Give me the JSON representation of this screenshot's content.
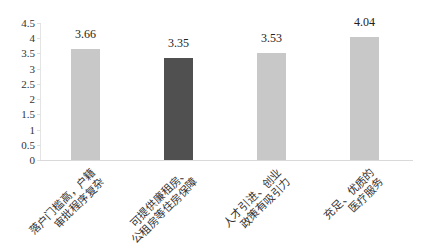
{
  "chart_data": {
    "type": "bar",
    "title": "",
    "xlabel": "",
    "ylabel": "",
    "ylim": [
      0,
      4.5
    ],
    "yticks": [
      "0",
      "0.5",
      "1",
      "1.5",
      "2",
      "2.5",
      "3",
      "3.5",
      "4",
      "4.5"
    ],
    "grid": false,
    "legend": null,
    "categories": [
      "落户门槛高，户籍审批程序复杂",
      "可提供廉租房、公租房等住房保障",
      "人才引进、创业政策有吸引力",
      "充足、优质的医疗服务"
    ],
    "category_lines": [
      [
        "落户门槛高，户籍",
        "审批程序复杂"
      ],
      [
        "可提供廉租房、",
        "公租房等住房保障"
      ],
      [
        "人才引进、创业",
        "政策有吸引力"
      ],
      [
        "充足、优质的",
        "医疗服务"
      ]
    ],
    "values": [
      3.66,
      3.35,
      3.53,
      4.04
    ],
    "value_labels": [
      "3.66",
      "3.35",
      "3.53",
      "4.04"
    ],
    "bar_colors": [
      "#c8c8c8",
      "#505050",
      "#c8c8c8",
      "#c8c8c8"
    ]
  }
}
